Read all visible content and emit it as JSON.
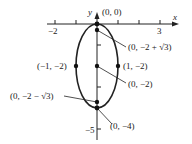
{
  "diagram": {
    "type": "ellipse-graph",
    "axes": {
      "x_label": "x",
      "y_label": "y",
      "x_tick_labels": [
        "-2",
        "3"
      ],
      "y_tick_labels": [
        "-5"
      ]
    },
    "points": [
      {
        "label": "(0, 0)",
        "x": 0,
        "y": 0
      },
      {
        "label": "(0, −2 + √3)",
        "x": 0,
        "y": -0.268
      },
      {
        "label": "(−1, −2)",
        "x": -1,
        "y": -2
      },
      {
        "label": "(1, −2)",
        "x": 1,
        "y": -2
      },
      {
        "label": "(0, −2)",
        "x": 0,
        "y": -2
      },
      {
        "label": "(0, −2 − √3)",
        "x": 0,
        "y": -3.732
      },
      {
        "label": "(0, −4)",
        "x": 0,
        "y": -4
      }
    ],
    "ellipse": {
      "center": [
        0,
        -2
      ],
      "semi_x": 1,
      "semi_y": 2
    }
  },
  "labels": {
    "x_axis": "x",
    "y_axis": "y",
    "tick_neg2": "−2",
    "tick_3": "3",
    "tick_neg5": "−5",
    "p_origin": "(0, 0)",
    "p_focus_top": "(0, −2 + √3)",
    "p_left": "(−1, −2)",
    "p_right": "(1, −2)",
    "p_center": "(0, −2)",
    "p_focus_bottom": "(0, −2 − √3)",
    "p_bottom": "(0, −4)"
  }
}
